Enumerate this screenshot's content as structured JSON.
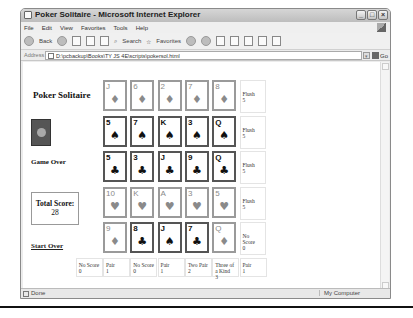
{
  "window": {
    "title": "Poker Solitaire - Microsoft Internet Explorer",
    "controls": [
      "_",
      "□",
      "×"
    ]
  },
  "menu": [
    "File",
    "Edit",
    "View",
    "Favorites",
    "Tools",
    "Help"
  ],
  "toolbar": {
    "back_label": "Back",
    "search_label": "Search",
    "favorites_label": "Favorites"
  },
  "address": {
    "label": "Address",
    "value": "D:\\pcbackup\\Books\\TY JS 4E\\scripts\\pokersol.html",
    "go_label": "Go"
  },
  "page": {
    "title": "Poker Solitaire",
    "status": "Game Over",
    "total_score_label": "Total Score:",
    "total_score": "28",
    "start_over": "Start Over"
  },
  "grid": {
    "rows": [
      {
        "faded": true,
        "cards": [
          {
            "rank": "J",
            "suit": "♦"
          },
          {
            "rank": "6",
            "suit": "♦"
          },
          {
            "rank": "2",
            "suit": "♦"
          },
          {
            "rank": "7",
            "suit": "♦"
          },
          {
            "rank": "8",
            "suit": "♦"
          }
        ],
        "score_name": "Flush",
        "score_val": "5"
      },
      {
        "faded": false,
        "cards": [
          {
            "rank": "5",
            "suit": "♠"
          },
          {
            "rank": "7",
            "suit": "♠"
          },
          {
            "rank": "K",
            "suit": "♠"
          },
          {
            "rank": "3",
            "suit": "♠"
          },
          {
            "rank": "Q",
            "suit": "♠"
          }
        ],
        "score_name": "Flush",
        "score_val": "5"
      },
      {
        "faded": false,
        "cards": [
          {
            "rank": "5",
            "suit": "♣"
          },
          {
            "rank": "3",
            "suit": "♣"
          },
          {
            "rank": "J",
            "suit": "♣"
          },
          {
            "rank": "9",
            "suit": "♣"
          },
          {
            "rank": "Q",
            "suit": "♣"
          }
        ],
        "score_name": "Flush",
        "score_val": "5"
      },
      {
        "faded": true,
        "cards": [
          {
            "rank": "10",
            "suit": "♥"
          },
          {
            "rank": "K",
            "suit": "♥"
          },
          {
            "rank": "A",
            "suit": "♥"
          },
          {
            "rank": "3",
            "suit": "♥"
          },
          {
            "rank": "5",
            "suit": "♥"
          }
        ],
        "score_name": "Flush",
        "score_val": "5"
      },
      {
        "faded": false,
        "cards": [
          {
            "rank": "9",
            "suit": "♦",
            "faded": true
          },
          {
            "rank": "8",
            "suit": "♣"
          },
          {
            "rank": "J",
            "suit": "♠"
          },
          {
            "rank": "7",
            "suit": "♣"
          },
          {
            "rank": "Q",
            "suit": "♦",
            "faded": true
          }
        ],
        "score_name": "No Score",
        "score_val": "0"
      }
    ],
    "bottom_scores": [
      {
        "name": "No Score",
        "val": "0"
      },
      {
        "name": "Pair",
        "val": "1"
      },
      {
        "name": "No Score",
        "val": "0"
      },
      {
        "name": "Pair",
        "val": "1"
      },
      {
        "name": "Two Pair",
        "val": "2"
      },
      {
        "name": "Three of a Kind",
        "val": "3"
      },
      {
        "name": "Pair",
        "val": "1"
      }
    ]
  },
  "statusbar": {
    "left": "Done",
    "zone": "My Computer"
  }
}
